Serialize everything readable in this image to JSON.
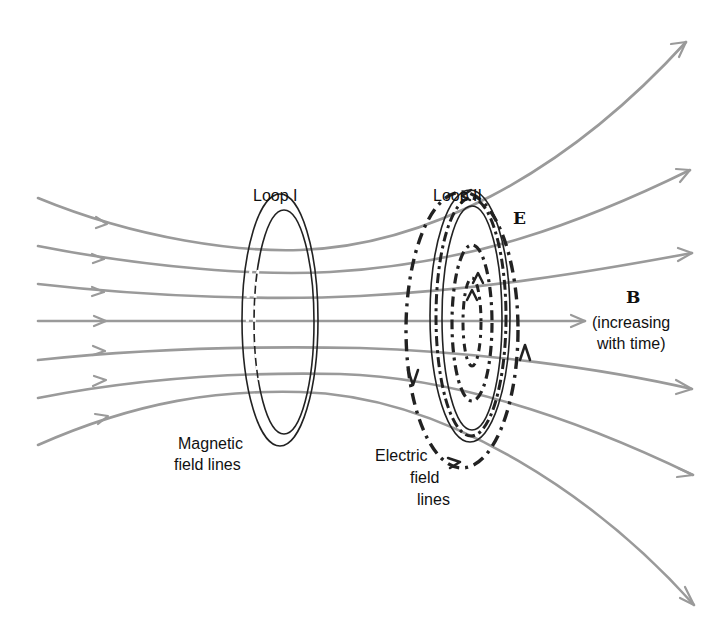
{
  "diagram": {
    "labels": {
      "loop1": "Loop I",
      "loop2": "Loop II",
      "e_field": "E",
      "b_field": "B",
      "b_note_line1": "(increasing",
      "b_note_line2": "with time)",
      "magnetic_line1": "Magnetic",
      "magnetic_line2": "field lines",
      "electric_line1": "Electric",
      "electric_line2": "field",
      "electric_line3": "lines"
    },
    "colors": {
      "field_line": "#9a9a9a",
      "ink": "#222222",
      "background": "#ffffff"
    },
    "magnetic_field_lines": [
      {
        "id": 1,
        "start": [
          38,
          198
        ],
        "end": [
          686,
          42
        ]
      },
      {
        "id": 2,
        "start": [
          38,
          246
        ],
        "end": [
          690,
          170
        ]
      },
      {
        "id": 3,
        "start": [
          38,
          284
        ],
        "end": [
          692,
          253
        ]
      },
      {
        "id": 4,
        "start": [
          38,
          321
        ],
        "end": [
          585,
          321
        ]
      },
      {
        "id": 5,
        "start": [
          38,
          360
        ],
        "end": [
          692,
          389
        ]
      },
      {
        "id": 6,
        "start": [
          38,
          398
        ],
        "end": [
          693,
          475
        ]
      },
      {
        "id": 7,
        "start": [
          38,
          445
        ],
        "end": [
          694,
          605
        ]
      }
    ],
    "loops": [
      {
        "name": "Loop I",
        "cx": 280,
        "cy": 320,
        "rx_outer": 37,
        "ry_outer": 126
      },
      {
        "name": "Loop II",
        "cx": 470,
        "cy": 318,
        "rx_outer": 37,
        "ry_outer": 126
      }
    ]
  }
}
